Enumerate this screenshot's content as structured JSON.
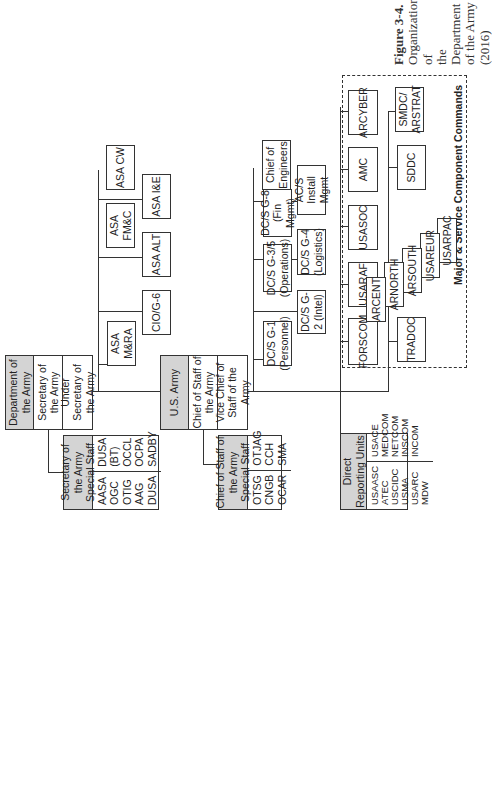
{
  "figure": {
    "caption_title": "Figure 3-4.",
    "caption_lines": [
      "Organization of",
      "the Department",
      "of the Army (2016)"
    ]
  },
  "department": {
    "header": "Department of the Army",
    "rows": [
      "Secretary of the Army",
      "Under Secretary of the Army"
    ]
  },
  "secretariat": {
    "boxes": [
      "ASA M&RA",
      "CIO/G-6",
      "ASA ALT",
      "ASA FM&C",
      "ASA I&E",
      "ASA CW"
    ]
  },
  "sec_staff": {
    "header": "Secretary of the Army Special Staff",
    "col1": [
      "AASA",
      "OGC",
      "OTIG",
      "AAG",
      "DUSA"
    ],
    "col2": [
      "DUSA",
      "(BT)",
      "OCCL",
      "OCPA",
      "SADBY"
    ]
  },
  "army": {
    "header": "U.S. Army",
    "rows": [
      "Chief of Staff of the Army",
      "Vice Chief of Staff of the Army"
    ]
  },
  "army_staff": {
    "boxes": [
      "DC/S G-1 (Personnel)",
      "DC/S G-2 (Intel)",
      "DC/S G-3/5 (Operations)",
      "DC/S G-4 (Logistics)",
      "DC/S G-8 (Fin Mgmt)",
      "AC/S Install Mgmt",
      "Chief of Engineers"
    ]
  },
  "csa_staff": {
    "header": "Chief of Staff of the Army Special Staff",
    "col1": [
      "OTSG",
      "CNGB",
      "OCAR"
    ],
    "col2": [
      "OTJAG",
      "CCH",
      "SMA"
    ]
  },
  "dru": {
    "header": "Direct Reporting Units",
    "col1": [
      "USAASC",
      "ATEC",
      "USCIDC",
      "USMA",
      "USARC",
      "MDW"
    ],
    "col2": [
      "USACE",
      "MEDCOM",
      "NETCOM",
      "INSCOM",
      "INCOM"
    ]
  },
  "commands": {
    "label": "Major & Service Component Commands",
    "top_row": [
      "FORSCOM",
      "USARAF",
      "USASOC",
      "AMC",
      "ARCYBER"
    ],
    "bottom_row": [
      "TRADOC",
      "SDDC",
      "SMDC/ ARSTRAT"
    ],
    "cascade": [
      "ARCENT",
      "ARNORTH",
      "ARSOUTH",
      "USAREUR",
      "USARPAC"
    ]
  }
}
